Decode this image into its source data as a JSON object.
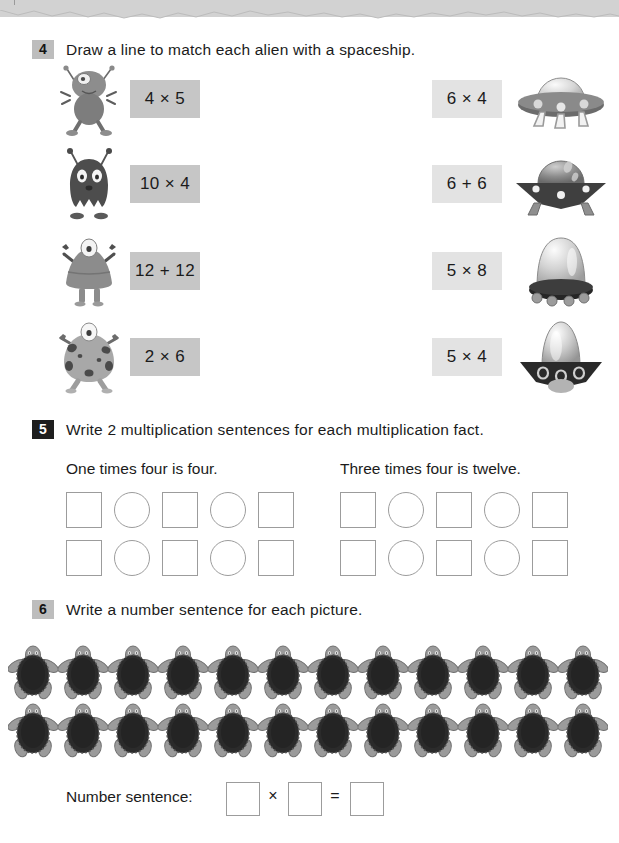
{
  "page": {
    "top_band_color": "#d2d2d2",
    "paper_color": "#ffffff"
  },
  "questions": [
    {
      "number": "4",
      "badge_style": "gray",
      "instruction": "Draw a line to match each alien with a spaceship.",
      "left_column": [
        {
          "icon": "alien-round-antenna-icon",
          "fact": "4 × 5"
        },
        {
          "icon": "alien-ghost-antenna-icon",
          "fact": "10 × 4"
        },
        {
          "icon": "alien-dome-arms-icon",
          "fact": "12 + 12"
        },
        {
          "icon": "alien-spotted-blob-icon",
          "fact": "2 × 6"
        }
      ],
      "right_column": [
        {
          "fact": "6 × 4",
          "icon": "ufo-saucer-dome-icon"
        },
        {
          "fact": "6 + 6",
          "icon": "ufo-flat-angular-icon"
        },
        {
          "fact": "5 × 8",
          "icon": "ufo-tall-dome-icon"
        },
        {
          "fact": "5 × 4",
          "icon": "ufo-rocket-cone-icon"
        }
      ]
    },
    {
      "number": "5",
      "badge_style": "dark",
      "instruction": "Write 2 multiplication sentences for each multiplication fact.",
      "groups": [
        {
          "caption": "One times four is four.",
          "rows": [
            [
              "square",
              "circle",
              "square",
              "circle",
              "square"
            ],
            [
              "square",
              "circle",
              "square",
              "circle",
              "square"
            ]
          ]
        },
        {
          "caption": "Three times four is twelve.",
          "rows": [
            [
              "square",
              "circle",
              "square",
              "circle",
              "square"
            ],
            [
              "square",
              "circle",
              "square",
              "circle",
              "square"
            ]
          ]
        }
      ]
    },
    {
      "number": "6",
      "badge_style": "gray",
      "instruction": "Write a number sentence for each picture.",
      "picture": {
        "item_icon": "turtle-icon",
        "rows": 2,
        "per_row": 12,
        "total": 24
      },
      "number_sentence": {
        "label": "Number sentence:",
        "box1_value": "",
        "operator": "×",
        "box2_value": "",
        "equals": "=",
        "box3_value": ""
      }
    }
  ]
}
